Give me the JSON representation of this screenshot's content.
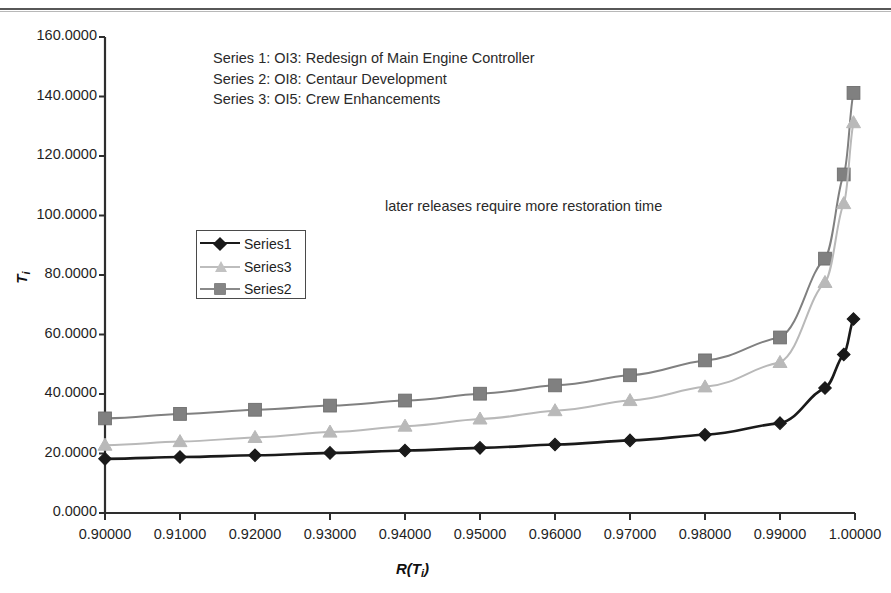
{
  "chart_data": {
    "type": "line",
    "title": "",
    "xlabel": "R(Ti)",
    "ylabel": "Ti",
    "xlim": [
      0.9,
      1.0
    ],
    "ylim": [
      0.0,
      160.0
    ],
    "grid": false,
    "legend_position": "inside-left",
    "x_ticks": [
      "0.90000",
      "0.91000",
      "0.92000",
      "0.93000",
      "0.94000",
      "0.95000",
      "0.96000",
      "0.97000",
      "0.98000",
      "0.99000",
      "1.00000"
    ],
    "y_ticks": [
      "0.0000",
      "20.0000",
      "40.0000",
      "60.0000",
      "80.0000",
      "100.0000",
      "120.0000",
      "140.0000",
      "160.0000"
    ],
    "x": [
      0.9,
      0.91,
      0.92,
      0.93,
      0.94,
      0.95,
      0.96,
      0.97,
      0.98,
      0.99,
      0.996,
      0.9985,
      0.9998
    ],
    "series": [
      {
        "name": "Series1",
        "color": "#1a1a1a",
        "marker": "diamond",
        "values": [
          18.2,
          18.8,
          19.4,
          20.2,
          21.0,
          21.9,
          23.0,
          24.4,
          26.3,
          30.2,
          42.0,
          53.3,
          65.2
        ]
      },
      {
        "name": "Series3",
        "color": "#b9b9b9",
        "marker": "triangle",
        "values": [
          22.8,
          24.0,
          25.4,
          27.2,
          29.2,
          31.6,
          34.4,
          37.8,
          42.4,
          50.6,
          77.5,
          104.0,
          131.2
        ]
      },
      {
        "name": "Series2",
        "color": "#808080",
        "marker": "square",
        "values": [
          31.8,
          33.3,
          34.7,
          36.1,
          37.8,
          40.1,
          42.9,
          46.3,
          51.3,
          59.0,
          85.5,
          113.8,
          141.2
        ]
      }
    ],
    "annotations": [
      "later releases require more restoration time"
    ],
    "series_descriptions": [
      "Series 1: OI3: Redesign of Main Engine Controller",
      "Series 2: OI8: Centaur Development",
      "Series 3: OI5: Crew Enhancements"
    ],
    "legend_entries": [
      {
        "label": "Series1",
        "color": "#1a1a1a",
        "marker": "diamond"
      },
      {
        "label": "Series3",
        "color": "#b9b9b9",
        "marker": "triangle"
      },
      {
        "label": "Series2",
        "color": "#808080",
        "marker": "square"
      }
    ]
  }
}
